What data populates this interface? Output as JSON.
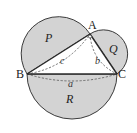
{
  "diagram": {
    "type": "geometry",
    "vertices": {
      "A": "A",
      "B": "B",
      "C": "C"
    },
    "sides": {
      "a": "a",
      "b": "b",
      "c": "c"
    },
    "regions": {
      "P": "P",
      "Q": "Q",
      "R": "R"
    },
    "right_angle_at": "A",
    "colors": {
      "region_fill": "#d3d3d3",
      "stroke": "#2a2a2a",
      "background": "#ffffff"
    }
  }
}
